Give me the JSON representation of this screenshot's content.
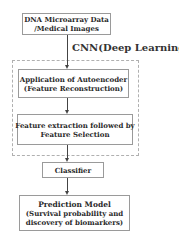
{
  "diagram": {
    "nodes": {
      "input": {
        "line1": "DNA Microarray Data",
        "line2": "/Medical Images"
      },
      "autoencoder": {
        "line1": "Application of Autoencoder",
        "line2": "(Feature Reconstruction)"
      },
      "feature": {
        "line1": "Feature extraction followed by",
        "line2": "Feature Selection"
      },
      "classifier": {
        "line1": "Classifier"
      },
      "prediction": {
        "line1": "Prediction Model",
        "line2": "(Survival probability and",
        "line3": "discovery of biomarkers)"
      }
    },
    "group_label": "CNN(Deep Learning)",
    "edges": [
      [
        "input",
        "autoencoder"
      ],
      [
        "autoencoder",
        "feature"
      ],
      [
        "feature",
        "classifier"
      ],
      [
        "classifier",
        "prediction"
      ]
    ]
  }
}
